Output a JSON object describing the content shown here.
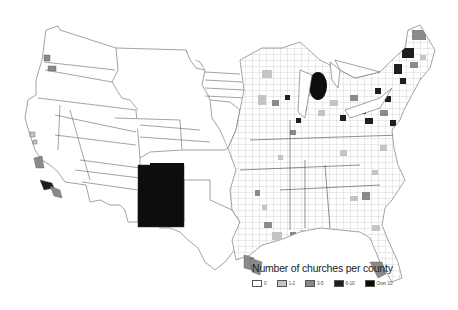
{
  "map": {
    "title": "Number of churches per county",
    "region": "United States (county level)",
    "colors": {
      "background": "#ffffff",
      "outline": "#555555",
      "class_0": "#ffffff",
      "class_1_2": "#c4c4c4",
      "class_3_5": "#8a8a8a",
      "class_6_10": "#1e1e1e",
      "class_over_10": "#0a0a0a"
    }
  },
  "legend": {
    "title": "Number of churches per county",
    "items": [
      {
        "label": "0",
        "color": "#ffffff"
      },
      {
        "label": "1-2",
        "color": "#c4c4c4"
      },
      {
        "label": "3-5",
        "color": "#8a8a8a"
      },
      {
        "label": "6-10",
        "color": "#1e1e1e"
      },
      {
        "label": "Over 10",
        "color": "#0a0a0a"
      }
    ]
  }
}
